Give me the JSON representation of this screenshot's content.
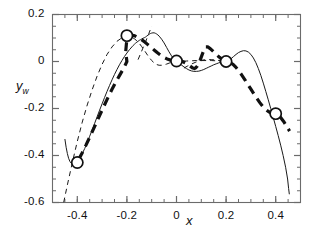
{
  "chart_data": {
    "type": "line",
    "title": "",
    "xlabel": "x",
    "ylabel": "y_w",
    "ylabel_base": "y",
    "ylabel_sub": "w",
    "xlim": [
      -0.5,
      0.5
    ],
    "ylim": [
      -0.6,
      0.2
    ],
    "xticks": [
      -0.4,
      -0.2,
      0,
      0.2,
      0.4
    ],
    "xticklabels": [
      "-0.4",
      "-0.2",
      "0",
      "0.2",
      "0.4"
    ],
    "yticks": [
      0.2,
      0,
      -0.2,
      -0.4,
      -0.6
    ],
    "yticklabels": [
      "0.2",
      "0",
      "-0.2",
      "-0.4",
      "-0.6"
    ],
    "x_minor_step": 0.05,
    "y_minor_step": 0.05,
    "grid": false,
    "legend": "none",
    "axis_color": "#6b6b6b",
    "series": [
      {
        "name": "solid-thin-curve",
        "style": "solid",
        "width": 1.0,
        "color": "#1a1a1a",
        "points": [
          [
            -0.45,
            -0.33
          ],
          [
            -0.445,
            -0.365
          ],
          [
            -0.44,
            -0.392
          ],
          [
            -0.435,
            -0.412
          ],
          [
            -0.43,
            -0.425
          ],
          [
            -0.425,
            -0.432
          ],
          [
            -0.42,
            -0.435
          ],
          [
            -0.415,
            -0.434
          ],
          [
            -0.41,
            -0.431
          ],
          [
            -0.4,
            -0.424
          ],
          [
            -0.39,
            -0.41
          ],
          [
            -0.38,
            -0.392
          ],
          [
            -0.37,
            -0.37
          ],
          [
            -0.36,
            -0.345
          ],
          [
            -0.35,
            -0.318
          ],
          [
            -0.34,
            -0.291
          ],
          [
            -0.33,
            -0.263
          ],
          [
            -0.32,
            -0.235
          ],
          [
            -0.31,
            -0.207
          ],
          [
            -0.3,
            -0.18
          ],
          [
            -0.29,
            -0.153
          ],
          [
            -0.28,
            -0.127
          ],
          [
            -0.27,
            -0.102
          ],
          [
            -0.26,
            -0.078
          ],
          [
            -0.25,
            -0.055
          ],
          [
            -0.24,
            -0.034
          ],
          [
            -0.23,
            -0.014
          ],
          [
            -0.22,
            0.004
          ],
          [
            -0.21,
            0.021
          ],
          [
            -0.2,
            0.036
          ],
          [
            -0.19,
            0.05
          ],
          [
            -0.18,
            0.062
          ],
          [
            -0.175,
            0.068
          ],
          [
            -0.17,
            0.073
          ],
          [
            -0.165,
            0.078
          ],
          [
            -0.16,
            0.082
          ],
          [
            -0.155,
            0.086
          ],
          [
            -0.15,
            0.09
          ],
          [
            -0.145,
            0.093
          ],
          [
            -0.14,
            0.096
          ],
          [
            -0.135,
            0.099
          ],
          [
            -0.13,
            0.101
          ],
          [
            -0.125,
            0.104
          ],
          [
            -0.12,
            0.108
          ],
          [
            -0.115,
            0.112
          ],
          [
            -0.11,
            0.116
          ],
          [
            -0.105,
            0.119
          ],
          [
            -0.1,
            0.121
          ],
          [
            -0.095,
            0.122
          ],
          [
            -0.09,
            0.122
          ],
          [
            -0.085,
            0.12
          ],
          [
            -0.08,
            0.117
          ],
          [
            -0.075,
            0.113
          ],
          [
            -0.07,
            0.108
          ],
          [
            -0.06,
            0.095
          ],
          [
            -0.05,
            0.079
          ],
          [
            -0.04,
            0.06
          ],
          [
            -0.03,
            0.041
          ],
          [
            -0.02,
            0.024
          ],
          [
            -0.01,
            0.01
          ],
          [
            0.0,
            0.001
          ],
          [
            0.01,
            -0.007
          ],
          [
            0.02,
            -0.015
          ],
          [
            0.03,
            -0.023
          ],
          [
            0.04,
            -0.03
          ],
          [
            0.05,
            -0.036
          ],
          [
            0.06,
            -0.04
          ],
          [
            0.07,
            -0.042
          ],
          [
            0.08,
            -0.042
          ],
          [
            0.09,
            -0.041
          ],
          [
            0.1,
            -0.038
          ],
          [
            0.11,
            -0.034
          ],
          [
            0.12,
            -0.029
          ],
          [
            0.13,
            -0.024
          ],
          [
            0.14,
            -0.019
          ],
          [
            0.15,
            -0.014
          ],
          [
            0.16,
            -0.01
          ],
          [
            0.17,
            -0.006
          ],
          [
            0.18,
            -0.003
          ],
          [
            0.19,
            -0.001
          ],
          [
            0.2,
            0.001
          ],
          [
            0.21,
            0.005
          ],
          [
            0.22,
            0.012
          ],
          [
            0.23,
            0.021
          ],
          [
            0.24,
            0.03
          ],
          [
            0.25,
            0.038
          ],
          [
            0.26,
            0.043
          ],
          [
            0.27,
            0.046
          ],
          [
            0.28,
            0.045
          ],
          [
            0.29,
            0.04
          ],
          [
            0.3,
            0.03
          ],
          [
            0.31,
            0.015
          ],
          [
            0.32,
            -0.005
          ],
          [
            0.33,
            -0.03
          ],
          [
            0.34,
            -0.059
          ],
          [
            0.35,
            -0.092
          ],
          [
            0.36,
            -0.127
          ],
          [
            0.37,
            -0.163
          ],
          [
            0.38,
            -0.2
          ],
          [
            0.39,
            -0.238
          ],
          [
            0.4,
            -0.276
          ],
          [
            0.41,
            -0.315
          ],
          [
            0.42,
            -0.356
          ],
          [
            0.43,
            -0.4
          ],
          [
            0.44,
            -0.45
          ],
          [
            0.448,
            -0.5
          ],
          [
            0.452,
            -0.54
          ],
          [
            0.455,
            -0.565
          ]
        ]
      },
      {
        "name": "dashed-thin-curve",
        "style": "dashed-thin",
        "width": 1.0,
        "color": "#1a1a1a",
        "dash": "5,4",
        "points": [
          [
            -0.455,
            -0.6
          ],
          [
            -0.44,
            -0.525
          ],
          [
            -0.42,
            -0.43
          ],
          [
            -0.4,
            -0.34
          ],
          [
            -0.38,
            -0.258
          ],
          [
            -0.36,
            -0.185
          ],
          [
            -0.34,
            -0.12
          ],
          [
            -0.32,
            -0.062
          ],
          [
            -0.3,
            -0.012
          ],
          [
            -0.28,
            0.03
          ],
          [
            -0.26,
            0.062
          ],
          [
            -0.24,
            0.086
          ],
          [
            -0.22,
            0.101
          ],
          [
            -0.21,
            0.105
          ],
          [
            -0.2,
            0.107
          ],
          [
            -0.19,
            0.106
          ],
          [
            -0.18,
            0.103
          ],
          [
            -0.17,
            0.097
          ],
          [
            -0.16,
            0.088
          ],
          [
            -0.15,
            0.077
          ],
          [
            -0.14,
            0.063
          ],
          [
            -0.13,
            0.048
          ],
          [
            -0.12,
            0.032
          ],
          [
            -0.11,
            0.017
          ],
          [
            -0.1,
            0.004
          ],
          [
            -0.09,
            -0.006
          ],
          [
            -0.08,
            -0.013
          ],
          [
            -0.07,
            -0.016
          ],
          [
            -0.06,
            -0.016
          ],
          [
            -0.05,
            -0.014
          ],
          [
            -0.04,
            -0.011
          ],
          [
            -0.03,
            -0.007
          ],
          [
            -0.02,
            -0.003
          ],
          [
            -0.01,
            -0.001
          ],
          [
            0.0,
            0.0
          ],
          [
            0.02,
            0.001
          ],
          [
            0.04,
            0.002
          ],
          [
            0.06,
            0.003
          ],
          [
            0.08,
            0.004
          ],
          [
            0.1,
            0.004
          ],
          [
            0.12,
            0.004
          ],
          [
            0.14,
            0.004
          ],
          [
            0.16,
            0.003
          ],
          [
            0.18,
            0.002
          ],
          [
            0.2,
            0.001
          ]
        ]
      },
      {
        "name": "dashed-thin-tangent",
        "style": "dashed-thin",
        "width": 1.0,
        "color": "#1a1a1a",
        "dash": "5,4",
        "points": [
          [
            -0.155,
            0.008
          ],
          [
            -0.145,
            0.033
          ],
          [
            -0.135,
            0.058
          ],
          [
            -0.125,
            0.083
          ],
          [
            -0.118,
            0.102
          ],
          [
            -0.112,
            0.118
          ],
          [
            -0.106,
            0.134
          ],
          [
            -0.1,
            0.15
          ]
        ]
      },
      {
        "name": "dashed-thin-mid-tangent",
        "style": "dashed-thin",
        "width": 1.0,
        "color": "#1a1a1a",
        "dash": "5,4",
        "points": [
          [
            0.03,
            -0.028
          ],
          [
            0.045,
            -0.019
          ],
          [
            0.06,
            -0.011
          ],
          [
            0.075,
            -0.004
          ],
          [
            0.09,
            0.002
          ],
          [
            0.105,
            0.006
          ],
          [
            0.12,
            0.008
          ],
          [
            0.14,
            0.008
          ],
          [
            0.16,
            0.006
          ],
          [
            0.18,
            0.003
          ],
          [
            0.2,
            0.0
          ]
        ]
      },
      {
        "name": "thick-dashed-curve",
        "style": "dashed-thick",
        "width": 3.2,
        "color": "#111111",
        "dash": "9,6",
        "points": [
          [
            -0.395,
            -0.418
          ],
          [
            -0.38,
            -0.388
          ],
          [
            -0.365,
            -0.356
          ],
          [
            -0.35,
            -0.322
          ],
          [
            -0.335,
            -0.288
          ],
          [
            -0.32,
            -0.253
          ],
          [
            -0.305,
            -0.218
          ],
          [
            -0.29,
            -0.184
          ],
          [
            -0.275,
            -0.15
          ],
          [
            -0.26,
            -0.118
          ],
          [
            -0.245,
            -0.088
          ],
          [
            -0.23,
            -0.06
          ],
          [
            -0.218,
            -0.038
          ],
          [
            -0.208,
            -0.018
          ],
          [
            -0.2,
            0.0
          ],
          [
            -0.205,
            0.04
          ],
          [
            -0.202,
            0.075
          ],
          [
            -0.199,
            0.098
          ],
          [
            -0.195,
            0.108
          ],
          [
            -0.188,
            0.112
          ],
          [
            -0.178,
            0.112
          ],
          [
            -0.168,
            0.109
          ],
          [
            -0.158,
            0.104
          ],
          [
            -0.148,
            0.098
          ],
          [
            -0.138,
            0.091
          ],
          [
            -0.128,
            0.083
          ],
          [
            -0.118,
            0.074
          ],
          [
            -0.108,
            0.065
          ],
          [
            -0.098,
            0.056
          ],
          [
            -0.088,
            0.047
          ],
          [
            -0.078,
            0.038
          ],
          [
            -0.068,
            0.03
          ],
          [
            -0.058,
            0.023
          ],
          [
            -0.048,
            0.016
          ],
          [
            -0.038,
            0.011
          ],
          [
            -0.028,
            0.007
          ],
          [
            -0.018,
            0.004
          ],
          [
            -0.008,
            0.002
          ],
          [
            0.0,
            0.001
          ]
        ]
      },
      {
        "name": "thick-dashed-right-curve",
        "style": "dashed-thick",
        "width": 3.2,
        "color": "#111111",
        "dash": "9,6",
        "points": [
          [
            0.0,
            0.001
          ],
          [
            0.012,
            0.002
          ],
          [
            0.024,
            0.0
          ],
          [
            0.036,
            -0.006
          ],
          [
            0.048,
            -0.014
          ],
          [
            0.058,
            -0.022
          ],
          [
            0.066,
            -0.028
          ],
          [
            0.072,
            -0.03
          ],
          [
            0.078,
            -0.027
          ],
          [
            0.084,
            -0.019
          ],
          [
            0.09,
            -0.007
          ],
          [
            0.096,
            0.008
          ],
          [
            0.102,
            0.025
          ],
          [
            0.108,
            0.042
          ],
          [
            0.112,
            0.054
          ],
          [
            0.118,
            0.062
          ],
          [
            0.126,
            0.062
          ],
          [
            0.136,
            0.055
          ],
          [
            0.148,
            0.043
          ],
          [
            0.16,
            0.03
          ],
          [
            0.172,
            0.019
          ],
          [
            0.184,
            0.009
          ],
          [
            0.196,
            0.002
          ],
          [
            0.205,
            -0.001
          ],
          [
            0.215,
            -0.004
          ],
          [
            0.228,
            -0.012
          ],
          [
            0.24,
            -0.025
          ],
          [
            0.252,
            -0.041
          ],
          [
            0.264,
            -0.059
          ],
          [
            0.276,
            -0.078
          ],
          [
            0.288,
            -0.098
          ],
          [
            0.3,
            -0.118
          ],
          [
            0.312,
            -0.138
          ],
          [
            0.324,
            -0.157
          ],
          [
            0.336,
            -0.175
          ],
          [
            0.348,
            -0.191
          ],
          [
            0.36,
            -0.204
          ],
          [
            0.372,
            -0.214
          ],
          [
            0.384,
            -0.22
          ],
          [
            0.396,
            -0.222
          ],
          [
            0.408,
            -0.226
          ],
          [
            0.42,
            -0.238
          ],
          [
            0.432,
            -0.255
          ],
          [
            0.444,
            -0.275
          ],
          [
            0.456,
            -0.296
          ]
        ]
      }
    ],
    "markers": {
      "name": "data-markers",
      "shape": "circle-open",
      "size": 5.6,
      "edge_width": 1.7,
      "color": "#111111",
      "points": [
        [
          -0.4,
          -0.43
        ],
        [
          -0.2,
          0.11
        ],
        [
          0.0,
          0.002
        ],
        [
          0.2,
          0.0
        ],
        [
          0.4,
          -0.222
        ]
      ]
    }
  }
}
